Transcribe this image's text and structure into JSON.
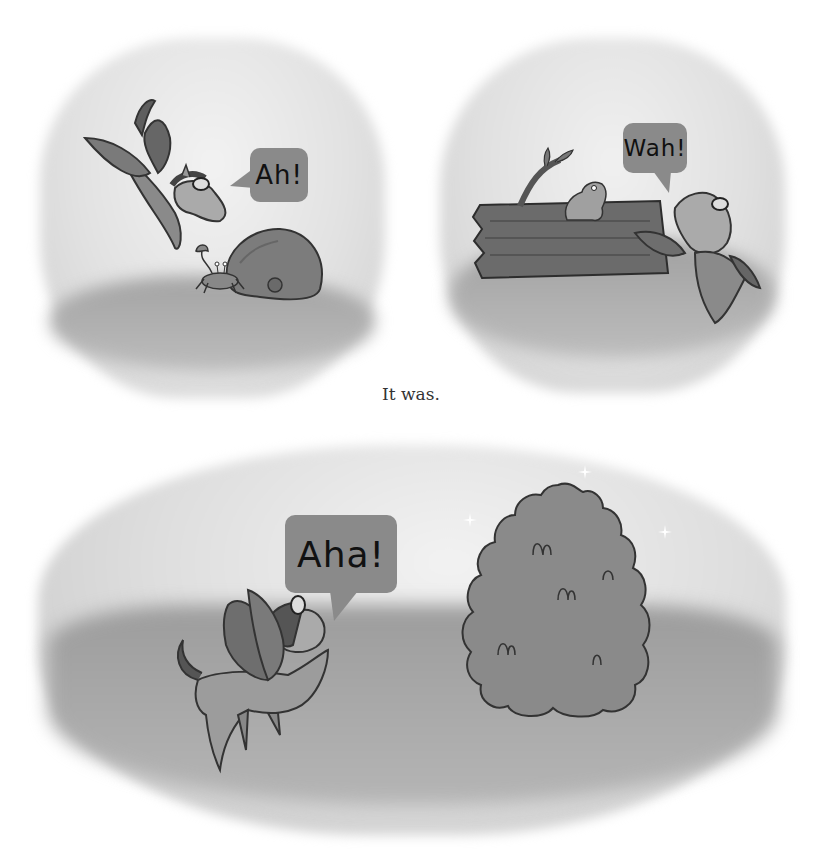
{
  "page": {
    "background": "#ffffff",
    "style": "grayscale children's picture book page, three vignette illustration panels"
  },
  "panels": [
    {
      "id": "panel-top-left",
      "scene": "winged pegasus with goggles swooping down toward a rock with a crab beside it",
      "speech_bubble": {
        "text": "Ah!",
        "tail": "left"
      }
    },
    {
      "id": "panel-top-right",
      "scene": "pegasus peeking from behind a hollow log with a frog sitting on top and a leafy twig",
      "speech_bubble": {
        "text": "Wah!",
        "tail": "bottom"
      }
    },
    {
      "id": "panel-bottom",
      "scene": "pegasus standing in grass looking at a sparkling round bush",
      "speech_bubble": {
        "text": "Aha!",
        "tail": "bottom"
      }
    }
  ],
  "caption": {
    "text": "It was."
  },
  "colors": {
    "sky": "#e4e4e4",
    "ground": "#9a9a9a",
    "bubble": "#8a8a8a",
    "ink": "#1a1a1a"
  }
}
